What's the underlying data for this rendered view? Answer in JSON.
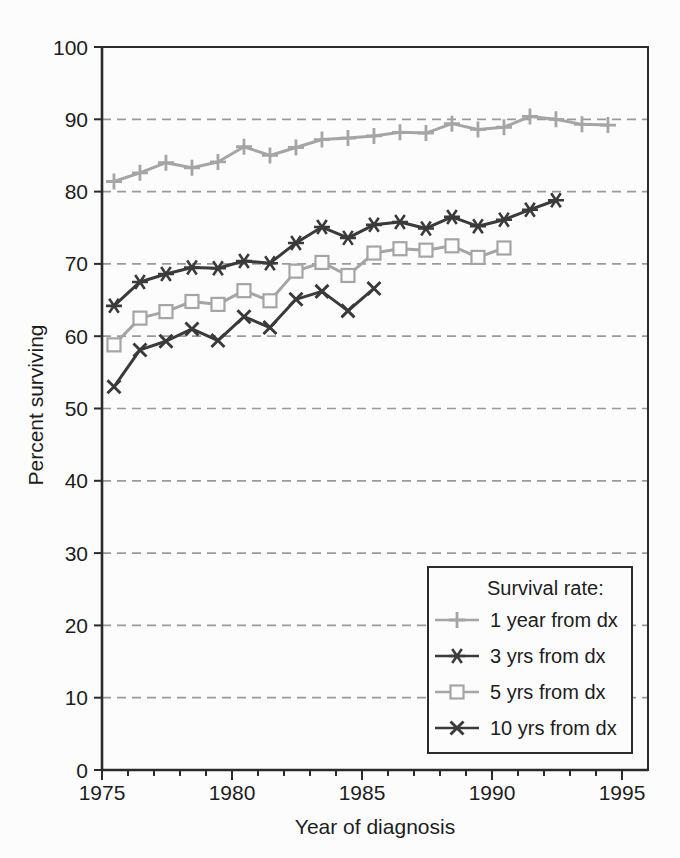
{
  "figure": {
    "kind": "scanned line chart of cancer survival rates by year of diagnosis"
  },
  "legend": {
    "title": "Survival rate:"
  },
  "colors": {
    "background": "#fcfcfc",
    "frame": "#2b2b2b",
    "grid": "#9a9a9a",
    "text": "#1d1d1d",
    "series_light": "#a5a5a5",
    "series_dark": "#3a3a3a"
  },
  "chart_data": {
    "type": "line",
    "title": "",
    "xlabel": "Year of diagnosis",
    "ylabel": "Percent surviving",
    "xlim": [
      1975,
      1996
    ],
    "ylim": [
      0,
      100
    ],
    "x_major_ticks": [
      1975,
      1980,
      1985,
      1990,
      1995
    ],
    "x_minor_tick_every_year": true,
    "y_ticks": [
      0,
      10,
      20,
      30,
      40,
      50,
      60,
      70,
      80,
      90,
      100
    ],
    "gridlines": {
      "horizontal_dashed_at": [
        10,
        20,
        30,
        40,
        50,
        60,
        70,
        80,
        90
      ],
      "vertical": false
    },
    "legend_position": "inside lower right",
    "point_x_offset_years": 0.46,
    "series": [
      {
        "name": "1 year from dx",
        "marker": "plus",
        "color": "light",
        "years": [
          1975,
          1976,
          1977,
          1978,
          1979,
          1980,
          1981,
          1982,
          1983,
          1984,
          1985,
          1986,
          1987,
          1988,
          1989,
          1990,
          1991,
          1992,
          1993,
          1994
        ],
        "values": [
          81.4,
          82.6,
          84.0,
          83.3,
          84.1,
          86.2,
          85.0,
          86.1,
          87.2,
          87.4,
          87.7,
          88.2,
          88.1,
          89.4,
          88.6,
          88.9,
          90.4,
          90.0,
          89.3,
          89.2
        ]
      },
      {
        "name": "3 yrs from dx",
        "marker": "asterisk",
        "color": "dark",
        "years": [
          1975,
          1976,
          1977,
          1978,
          1979,
          1980,
          1981,
          1982,
          1983,
          1984,
          1985,
          1986,
          1987,
          1988,
          1989,
          1990,
          1991,
          1992
        ],
        "values": [
          64.2,
          67.5,
          68.6,
          69.5,
          69.4,
          70.4,
          70.1,
          72.9,
          75.1,
          73.6,
          75.4,
          75.8,
          74.9,
          76.5,
          75.2,
          76.1,
          77.5,
          78.8
        ]
      },
      {
        "name": "5 yrs from dx",
        "marker": "square",
        "color": "light",
        "years": [
          1975,
          1976,
          1977,
          1978,
          1979,
          1980,
          1981,
          1982,
          1983,
          1984,
          1985,
          1986,
          1987,
          1988,
          1989,
          1990
        ],
        "values": [
          58.8,
          62.5,
          63.4,
          64.8,
          64.4,
          66.3,
          64.9,
          69.0,
          70.2,
          68.4,
          71.5,
          72.1,
          71.9,
          72.5,
          70.9,
          72.2
        ]
      },
      {
        "name": "10 yrs from dx",
        "marker": "x",
        "color": "dark",
        "years": [
          1975,
          1976,
          1977,
          1978,
          1979,
          1980,
          1981,
          1982,
          1983,
          1984,
          1985
        ],
        "values": [
          53.0,
          58.1,
          59.3,
          61.0,
          59.4,
          62.7,
          61.2,
          65.1,
          66.2,
          63.5,
          66.6
        ]
      }
    ]
  }
}
